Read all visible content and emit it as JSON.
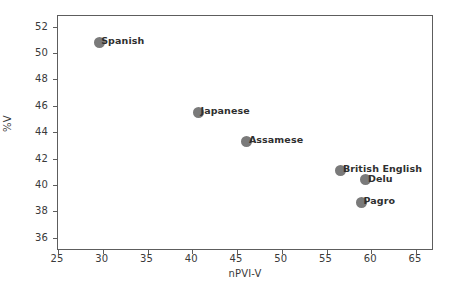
{
  "chart_data": {
    "type": "scatter",
    "title": "",
    "xlabel": "nPVI-V",
    "ylabel": "%V",
    "xlim": [
      25,
      67
    ],
    "ylim": [
      35,
      52.8
    ],
    "xticks": [
      25,
      30,
      35,
      40,
      45,
      50,
      55,
      60,
      65
    ],
    "yticks": [
      36,
      38,
      40,
      42,
      44,
      46,
      48,
      50,
      52
    ],
    "grid": false,
    "legend": "none",
    "marker_color": "#7a7a7a",
    "points": [
      {
        "label": "Spanish",
        "x": 29.6,
        "y": 50.8
      },
      {
        "label": "Japanese",
        "x": 40.7,
        "y": 45.5
      },
      {
        "label": "Assamese",
        "x": 46.1,
        "y": 43.3
      },
      {
        "label": "British English",
        "x": 56.6,
        "y": 41.1
      },
      {
        "label": "Delu",
        "x": 59.4,
        "y": 40.4
      },
      {
        "label": "Pagro",
        "x": 58.9,
        "y": 38.7
      }
    ]
  }
}
